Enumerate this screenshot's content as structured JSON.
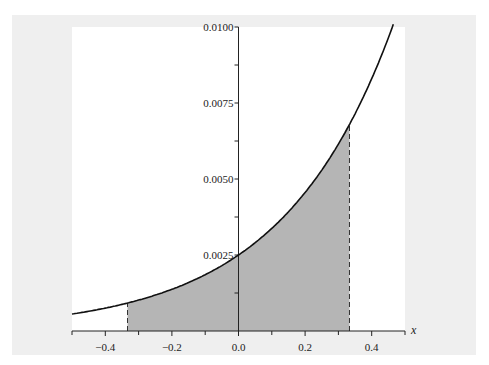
{
  "chart_data": {
    "type": "area",
    "title": "",
    "xlabel": "x",
    "ylabel": "",
    "function": "y = 0.0025 * e^(3x)",
    "xlim": [
      -0.5,
      0.5
    ],
    "ylim": [
      0,
      0.01
    ],
    "x_ticks": [
      -0.4,
      -0.2,
      0.0,
      0.2,
      0.4
    ],
    "x_tick_labels": [
      "−0.4",
      "−0.2",
      "0.0",
      "0.2",
      "0.4"
    ],
    "y_ticks": [
      0.0025,
      0.005,
      0.0075,
      0.01
    ],
    "y_tick_labels": [
      "0.0025",
      "0.0050",
      "0.0075",
      "0.0100"
    ],
    "shaded_region": {
      "x_from": -0.3333,
      "x_to": 0.3333,
      "y_at_from": 0.00092,
      "y_at_to": 0.0068
    },
    "x": [
      -0.5,
      -0.4,
      -0.3333,
      -0.2,
      -0.1,
      0.0,
      0.1,
      0.2,
      0.3,
      0.3333,
      0.4,
      0.46
    ],
    "values": [
      0.00056,
      0.00075,
      0.00092,
      0.00137,
      0.00185,
      0.0025,
      0.00337,
      0.00456,
      0.00615,
      0.0068,
      0.0083,
      0.0099
    ],
    "grid": false,
    "legend": null
  },
  "colors": {
    "panel": "#efefef",
    "plot_bg": "#ffffff",
    "shade": "#b5b5b5",
    "line": "#111111"
  }
}
